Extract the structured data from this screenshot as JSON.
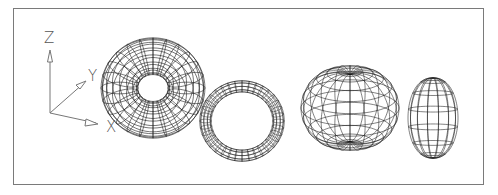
{
  "figure": {
    "type": "3D wireframe primitives",
    "axes": {
      "z_label": "Z",
      "y_label": "Y",
      "x_label": "X"
    },
    "objects": [
      {
        "name": "torus-thick",
        "kind": "torus",
        "description": "large torus, thick tube"
      },
      {
        "name": "torus-thin",
        "kind": "torus",
        "description": "smaller torus, thin tube"
      },
      {
        "name": "oblate-spheroid",
        "kind": "spheroid",
        "description": "torus with tube radius larger than major radius (self-intersecting, apple shape)"
      },
      {
        "name": "prolate-spheroid",
        "kind": "spheroid",
        "description": "lemon-shaped torus (negative major radius)"
      }
    ],
    "colors": {
      "background": "#ffffff",
      "frame": "#7a7a7a",
      "wire": "#1a1a1a",
      "axis": "#777777"
    }
  }
}
